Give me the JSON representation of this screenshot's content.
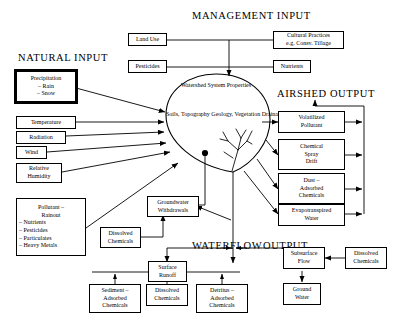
{
  "diagram": {
    "title_labels": {
      "management_input": "MANAGEMENT INPUT",
      "natural_input": "NATURAL INPUT",
      "airshed_output": "AIRSHED OUTPUT",
      "waterflow": "WATERFLOW",
      "output": "OUTPUT"
    },
    "center": {
      "heading_line1": "Watershed System",
      "heading_line2": "Properties",
      "body_line1": "Soils, Topography",
      "body_line2": "Geology, Vegetation",
      "body_line3": "Drainage and",
      "body_line4": "Well Network"
    },
    "management_boxes": [
      {
        "name": "land-use",
        "lines": [
          "Land Use"
        ]
      },
      {
        "name": "pesticides",
        "lines": [
          "Pesticides"
        ]
      },
      {
        "name": "cultural-practices",
        "lines": [
          "Cultural Practices",
          "e.g. Consv. Tillage"
        ]
      },
      {
        "name": "nutrients",
        "lines": [
          "Nutrients"
        ]
      }
    ],
    "natural_boxes": [
      {
        "name": "precipitation",
        "lines": [
          "Precipitation",
          "–  Rain",
          "–  Snow"
        ]
      },
      {
        "name": "temperature",
        "lines": [
          "Temperature"
        ]
      },
      {
        "name": "radiation",
        "lines": [
          "Radiation"
        ]
      },
      {
        "name": "wind",
        "lines": [
          "Wind"
        ]
      },
      {
        "name": "relative-humidity",
        "lines": [
          "Relative",
          "Humidity"
        ]
      },
      {
        "name": "pollutant-rainout",
        "lines": [
          "Pollutant –",
          "Rainout",
          "–  Nutrients",
          "–  Pesticides",
          "–  Particulates",
          "–  Heavy Metals"
        ]
      }
    ],
    "airshed_boxes": [
      {
        "name": "volatilized-pollutant",
        "lines": [
          "Volatilized",
          "Pollutant"
        ]
      },
      {
        "name": "chemical-spray-drift",
        "lines": [
          "Chemical",
          "Spray",
          "Drift"
        ]
      },
      {
        "name": "dust-adsorbed-chemicals",
        "lines": [
          "Dust –",
          "Adsorbed",
          "Chemicals"
        ]
      },
      {
        "name": "evapotranspired-water",
        "lines": [
          "Evapotranspired",
          "Water"
        ]
      }
    ],
    "water_boxes": [
      {
        "name": "groundwater-withdrawals",
        "lines": [
          "Groundwater",
          "Withdrawals"
        ]
      },
      {
        "name": "dissolved-chemicals-gw",
        "lines": [
          "Dissolved",
          "Chemicals"
        ]
      },
      {
        "name": "surface-runoff",
        "lines": [
          "Surface",
          "Runoff"
        ]
      },
      {
        "name": "sediment-adsorbed-chemicals",
        "lines": [
          "Sediment –",
          "Adsorbed",
          "Chemicals"
        ]
      },
      {
        "name": "dissolved-chemicals-runoff",
        "lines": [
          "Dissolved",
          "Chemicals"
        ]
      },
      {
        "name": "detritus-adsorbed-chemicals",
        "lines": [
          "Detritus –",
          "Adsorbed",
          "Chemicals"
        ]
      },
      {
        "name": "subsurface-flow",
        "lines": [
          "Subsurface",
          "Flow"
        ]
      },
      {
        "name": "dissolved-chemicals-subsurface",
        "lines": [
          "Dissolved",
          "Chemicals"
        ]
      },
      {
        "name": "ground-water",
        "lines": [
          "Ground",
          "Water"
        ]
      }
    ],
    "colors": {
      "ink": "#000000",
      "paper": "#ffffff"
    }
  }
}
